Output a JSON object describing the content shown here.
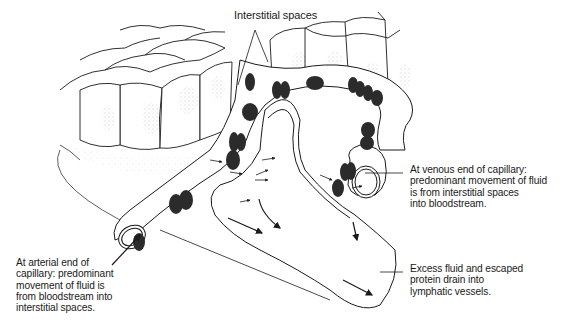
{
  "figure": {
    "labels": {
      "interstitial_spaces": "Interstitial spaces",
      "venous_end": "At venous end of capillary:\npredominant movement of fluid\nis from interstitial spaces\ninto bloodstream.",
      "arterial_end": "At arterial end of\ncapillary: predominant\nmovement of fluid is\nfrom bloodstream into\ninterstitial spaces.",
      "lymphatic": "Excess fluid and escaped\nprotein drain into\nlymphatic vessels."
    },
    "elements": {
      "tissue_cells": "tissue-cell-layer",
      "capillary": "blood-capillary",
      "lymphatic_vessel": "lymphatic-capillary",
      "red_blood_cells": "red-blood-cell",
      "flow_arrows": "fluid-flow-arrow"
    },
    "colors": {
      "line": "#1a1a1a",
      "rbc": "#2b2b2b",
      "stipple": "#9a9a9a",
      "background": "#ffffff"
    }
  }
}
